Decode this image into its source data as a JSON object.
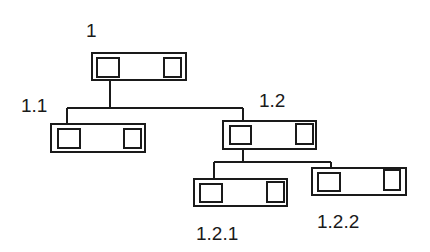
{
  "diagram": {
    "type": "tree",
    "stroke_color": "#1a1a1a",
    "nodes": [
      {
        "id": "1",
        "label": "1"
      },
      {
        "id": "1.1",
        "label": "1.1"
      },
      {
        "id": "1.2",
        "label": "1.2"
      },
      {
        "id": "1.2.1",
        "label": "1.2.1"
      },
      {
        "id": "1.2.2",
        "label": "1.2.2"
      }
    ],
    "edges": [
      {
        "from": "1",
        "to": "1.1"
      },
      {
        "from": "1",
        "to": "1.2"
      },
      {
        "from": "1.2",
        "to": "1.2.1"
      },
      {
        "from": "1.2",
        "to": "1.2.2"
      }
    ]
  }
}
